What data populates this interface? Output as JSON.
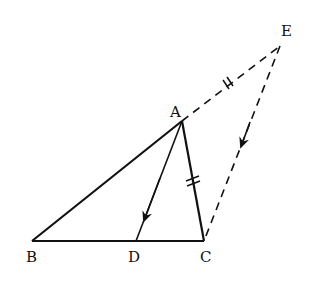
{
  "diagram": {
    "type": "geometry",
    "points": {
      "A": {
        "label": "A",
        "x": 182,
        "y": 121
      },
      "B": {
        "label": "B",
        "x": 32,
        "y": 241
      },
      "C": {
        "label": "C",
        "x": 204,
        "y": 241
      },
      "D": {
        "label": "D",
        "x": 136,
        "y": 241
      },
      "E": {
        "label": "E",
        "x": 280,
        "y": 46
      }
    },
    "segments": [
      {
        "from": "A",
        "to": "B",
        "style": "solid"
      },
      {
        "from": "B",
        "to": "C",
        "style": "solid"
      },
      {
        "from": "A",
        "to": "C",
        "style": "solid",
        "tick_marks": 2
      },
      {
        "from": "A",
        "to": "D",
        "style": "solid",
        "arrow": "toward D"
      },
      {
        "from": "A",
        "to": "E",
        "style": "dashed",
        "tick_marks": 2
      },
      {
        "from": "E",
        "to": "C",
        "style": "dashed",
        "arrow": "toward C"
      }
    ],
    "colors": {
      "stroke": "#111111",
      "background": "#ffffff"
    }
  }
}
